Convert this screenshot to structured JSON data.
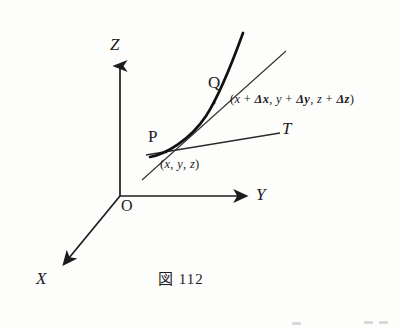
{
  "figure": {
    "caption": "図 112",
    "caption_number": "112",
    "axes": [
      {
        "name": "z-axis",
        "label": "Z",
        "direction": "up"
      },
      {
        "name": "y-axis",
        "label": "Y",
        "direction": "right"
      },
      {
        "name": "x-axis",
        "label": "X",
        "direction": "down-left"
      }
    ],
    "origin": {
      "label": "O"
    },
    "points": [
      {
        "name": "point-p",
        "label": "P",
        "coords_open": "(",
        "coords_text": "x, y, z",
        "coords_close": ")",
        "parts": [
          {
            "kind": "var",
            "text": "x"
          },
          {
            "kind": "sep",
            "text": ", "
          },
          {
            "kind": "var",
            "text": "y"
          },
          {
            "kind": "sep",
            "text": ", "
          },
          {
            "kind": "var",
            "text": "z"
          }
        ]
      },
      {
        "name": "point-q",
        "label": "Q",
        "coords_open": "(",
        "coords_text": "x + Δx, y + Δy, z + Δz",
        "coords_close": ")",
        "parts": [
          {
            "kind": "var",
            "text": "x"
          },
          {
            "kind": "op",
            "text": " + "
          },
          {
            "kind": "delta",
            "text": "Δx"
          },
          {
            "kind": "sep",
            "text": ", "
          },
          {
            "kind": "var",
            "text": "y"
          },
          {
            "kind": "op",
            "text": " + "
          },
          {
            "kind": "delta",
            "text": "Δy"
          },
          {
            "kind": "sep",
            "text": ", "
          },
          {
            "kind": "var",
            "text": "z"
          },
          {
            "kind": "op",
            "text": " + "
          },
          {
            "kind": "delta",
            "text": "Δz"
          }
        ]
      }
    ],
    "lines": [
      {
        "name": "tangent-line",
        "label": "T"
      },
      {
        "name": "secant-line-pq",
        "label": ""
      }
    ],
    "colors": {
      "ink": "#1c1c1c",
      "curve": "#111111",
      "thin_line": "#3a3a3a",
      "paper": "#fdfdfc"
    }
  }
}
